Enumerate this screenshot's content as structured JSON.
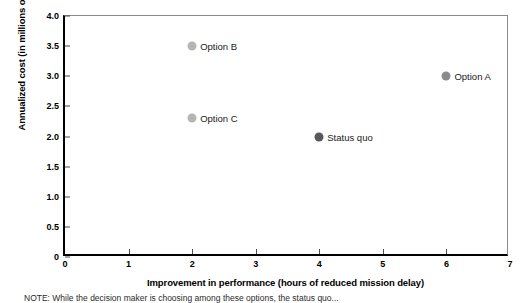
{
  "chart_data": {
    "type": "scatter",
    "title": "",
    "xlabel": "Improvement in performance (hours of reduced mission delay)",
    "ylabel": "Annualized cost (in millions of dollars)",
    "xlim": [
      0,
      7
    ],
    "ylim": [
      0,
      4.0
    ],
    "grid": false,
    "legend_position": "none",
    "xticks": [
      "0",
      "1",
      "2",
      "3",
      "4",
      "5",
      "6",
      "7"
    ],
    "xtick_values": [
      0,
      1,
      2,
      3,
      4,
      5,
      6,
      7
    ],
    "yticks": [
      "0",
      "0.5",
      "1.0",
      "1.5",
      "2.0",
      "2.5",
      "3.0",
      "3.5",
      "4.0"
    ],
    "ytick_values": [
      0,
      0.5,
      1.0,
      1.5,
      2.0,
      2.5,
      3.0,
      3.5,
      4.0
    ],
    "points": [
      {
        "label": "Option B",
        "x": 2,
        "y": 3.5,
        "color": "#b5b5b5"
      },
      {
        "label": "Option C",
        "x": 2,
        "y": 2.3,
        "color": "#b5b5b5"
      },
      {
        "label": "Option A",
        "x": 6,
        "y": 3.0,
        "color": "#8c8c8c"
      },
      {
        "label": "Status quo",
        "x": 4,
        "y": 2.0,
        "color": "#595959"
      }
    ]
  },
  "footnote": {
    "text": "NOTE: While the decision maker is choosing among these options, the status quo..."
  }
}
